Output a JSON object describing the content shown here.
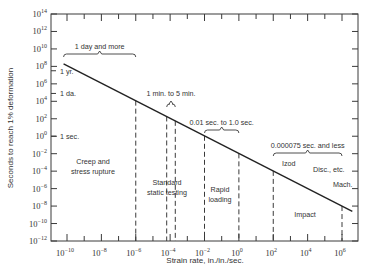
{
  "chart_data": {
    "type": "line",
    "title": "",
    "xlabel": "Strain rate, in./in./sec.",
    "ylabel": "Seconds to reach 1% deformation",
    "x_scale": "log",
    "y_scale": "log",
    "xlim_exp": [
      -11,
      7
    ],
    "ylim_exp": [
      -12,
      14
    ],
    "x_tick_exponents": [
      -10,
      -8,
      -6,
      -4,
      -2,
      0,
      2,
      4,
      6
    ],
    "y_tick_exponents": [
      14,
      12,
      10,
      8,
      6,
      4,
      2,
      0,
      -2,
      -4,
      -6,
      -8,
      -10,
      -12
    ],
    "grid": false,
    "legend": null,
    "series": [
      {
        "name": "Time to 1% deformation",
        "x_exp": [
          -10.2,
          6.6
        ],
        "y_exp": [
          8.3,
          -8.6
        ]
      }
    ],
    "y_reference_labels": [
      {
        "label": "1 yr.",
        "y_exp": 7.5
      },
      {
        "label": "1 da.",
        "y_exp": 4.9
      },
      {
        "label": "1 sec.",
        "y_exp": 0
      }
    ],
    "vertical_dashed_lines_x_exp": [
      -6,
      -4.2,
      -3.7,
      -2,
      0,
      2,
      6
    ],
    "brackets": [
      {
        "label": "1 day and more",
        "x_exp_range": [
          -10.2,
          -6
        ]
      },
      {
        "label": "1 min. to 5 min.",
        "x_exp_range": [
          -4.2,
          -3.7
        ]
      },
      {
        "label": "0.01 sec. to 1.0 sec.",
        "x_exp_range": [
          -2,
          0
        ]
      },
      {
        "label": "0.000075 sec. and less",
        "x_exp_range": [
          2,
          6
        ]
      }
    ],
    "regions": [
      {
        "label": [
          "Creep and",
          "stress rupture"
        ]
      },
      {
        "label": [
          "Standard",
          "static testing"
        ]
      },
      {
        "label": [
          "Rapid",
          "loading"
        ]
      },
      {
        "label": [
          "Impact"
        ]
      }
    ],
    "impact_sublabels": [
      "Izod",
      "Disc., etc.",
      "Mach."
    ]
  }
}
